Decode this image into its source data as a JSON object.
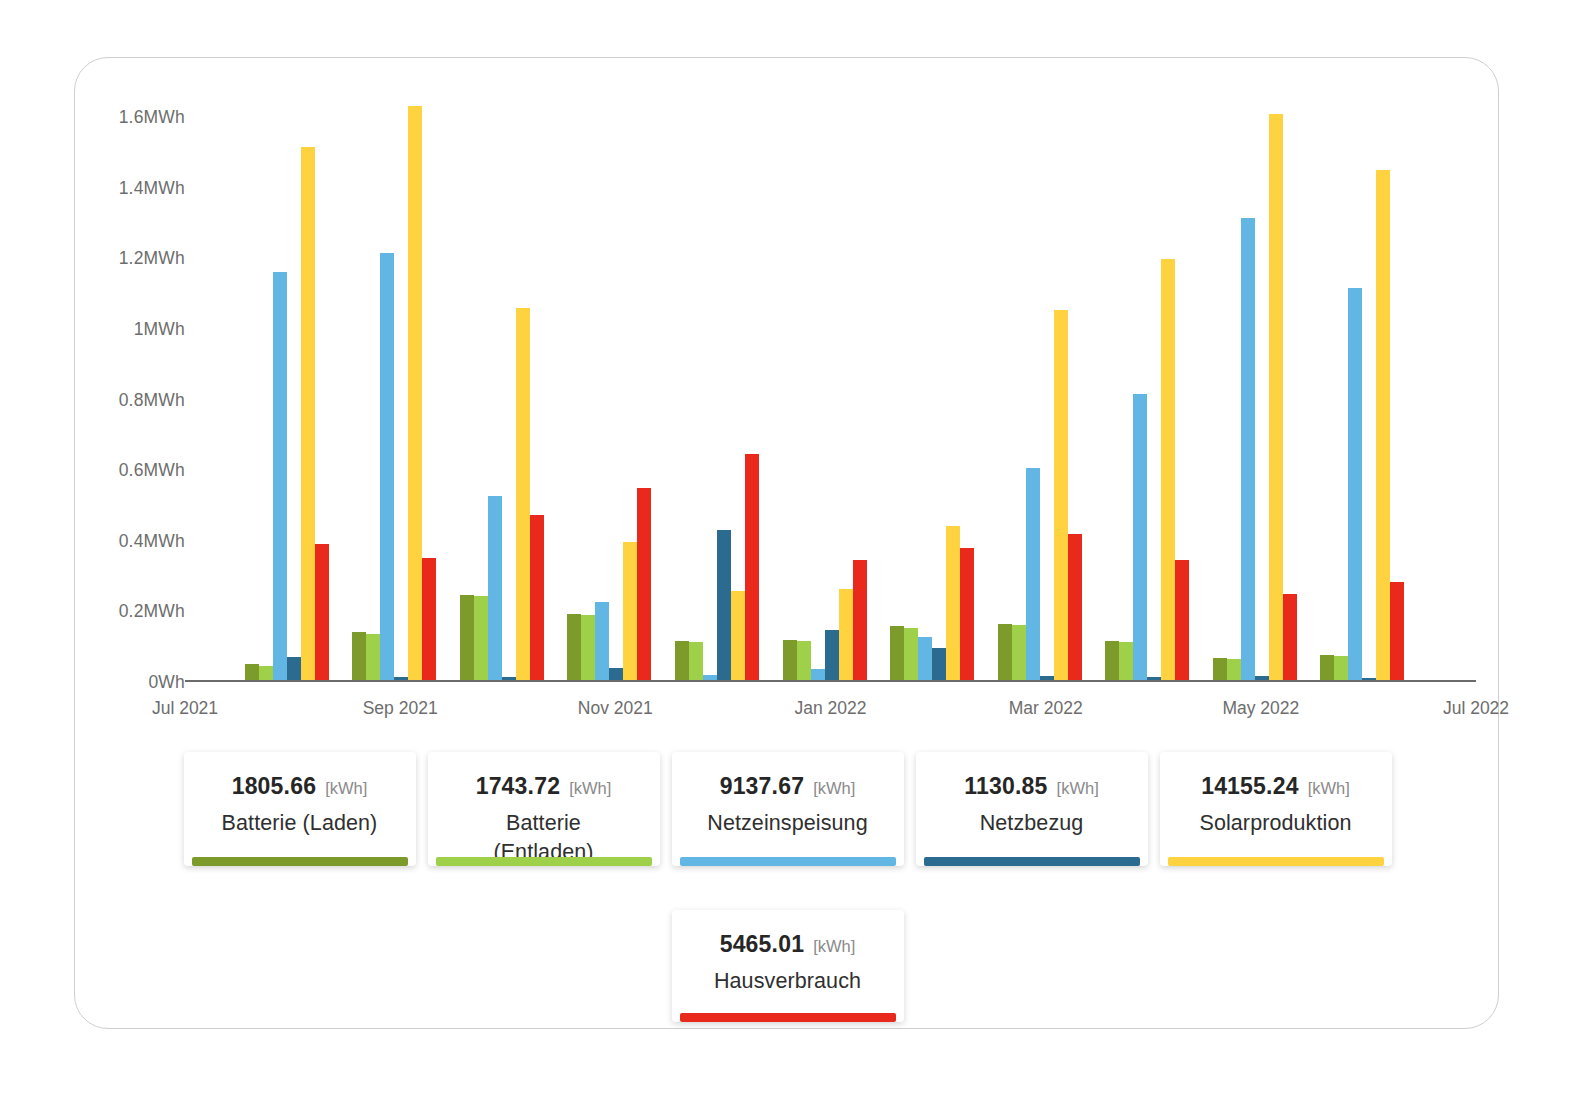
{
  "chart_data": {
    "type": "bar",
    "title": "",
    "xlabel": "",
    "ylabel": "",
    "ylim": [
      0,
      1.7
    ],
    "yunit": "MWh",
    "grid": false,
    "legend_position": "bottom",
    "yticks": [
      "0Wh",
      "0.2MWh",
      "0.4MWh",
      "0.6MWh",
      "0.8MWh",
      "1MWh",
      "1.2MWh",
      "1.4MWh",
      "1.6MWh"
    ],
    "ytick_values": [
      0,
      0.2,
      0.4,
      0.6,
      0.8,
      1.0,
      1.2,
      1.4,
      1.6
    ],
    "xticks": [
      "Jul 2021",
      "Sep 2021",
      "Nov 2021",
      "Jan 2022",
      "Mar 2022",
      "May 2022",
      "Jul 2022"
    ],
    "categories": [
      "Aug 2021",
      "Sep 2021",
      "Oct 2021",
      "Nov 2021",
      "Dec 2021",
      "Jan 2022",
      "Feb 2022",
      "Mar 2022",
      "Apr 2022",
      "May 2022",
      "Jun 2022"
    ],
    "series": [
      {
        "name": "Batterie (Laden)",
        "color": "#7d9b2a",
        "values": [
          0.045,
          0.135,
          0.24,
          0.188,
          0.11,
          0.112,
          0.152,
          0.16,
          0.11,
          0.063,
          0.07
        ]
      },
      {
        "name": "Batterie (Entladen)",
        "color": "#9fd04a",
        "values": [
          0.04,
          0.13,
          0.238,
          0.183,
          0.108,
          0.11,
          0.147,
          0.155,
          0.107,
          0.06,
          0.068
        ]
      },
      {
        "name": "Netzeinspeisung",
        "color": "#62b6e4",
        "values": [
          1.155,
          1.21,
          0.52,
          0.22,
          0.015,
          0.032,
          0.122,
          0.6,
          0.81,
          1.31,
          1.11
        ]
      },
      {
        "name": "Netzbezug",
        "color": "#2b6b8f",
        "values": [
          0.065,
          0.008,
          0.008,
          0.035,
          0.425,
          0.143,
          0.092,
          0.012,
          0.008,
          0.01,
          0.006
        ]
      },
      {
        "name": "Solarproduktion",
        "color": "#ffd23f",
        "values": [
          1.51,
          1.625,
          1.055,
          0.392,
          0.252,
          0.258,
          0.437,
          1.048,
          1.192,
          1.605,
          1.445
        ]
      },
      {
        "name": "Hausverbrauch",
        "color": "#e8291c",
        "values": [
          0.385,
          0.345,
          0.468,
          0.543,
          0.64,
          0.34,
          0.375,
          0.415,
          0.34,
          0.245,
          0.277
        ]
      }
    ]
  },
  "legend": {
    "unit": "[kWh]",
    "row1": [
      {
        "value": "1805.66",
        "unit": "[kWh]",
        "name": "Batterie (Laden)",
        "color": "#7d9b2a"
      },
      {
        "value": "1743.72",
        "unit": "[kWh]",
        "name": "Batterie\n(Entladen)",
        "color": "#9fd04a"
      },
      {
        "value": "9137.67",
        "unit": "[kWh]",
        "name": "Netzeinspeisung",
        "color": "#62b6e4"
      },
      {
        "value": "1130.85",
        "unit": "[kWh]",
        "name": "Netzbezug",
        "color": "#2b6b8f"
      },
      {
        "value": "14155.24",
        "unit": "[kWh]",
        "name": "Solarproduktion",
        "color": "#ffd23f"
      }
    ],
    "row2": [
      {
        "value": "5465.01",
        "unit": "[kWh]",
        "name": "Hausverbrauch",
        "color": "#e8291c"
      }
    ]
  }
}
